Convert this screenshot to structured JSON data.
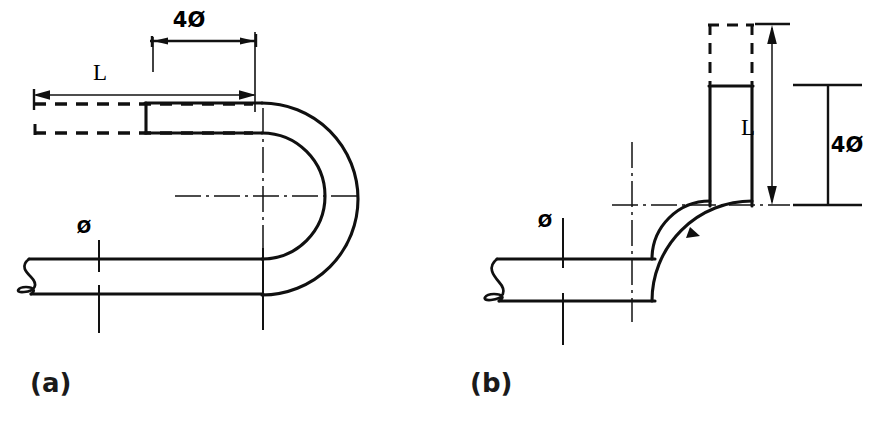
{
  "figure": {
    "background_color": "#ffffff",
    "line_color": "#101010",
    "width": 885,
    "height": 424
  },
  "panel_a": {
    "caption": "(a)",
    "description": "180-degree U-bend tube with straight leg length L and bend dimension 4 diameters",
    "labels": {
      "length": "L",
      "bend_dimension": "4Ø",
      "diameter": "Ø"
    },
    "geometry": {
      "tube_outer_diameter_label": "Ø",
      "bend_span_label": "4Ø",
      "leg_length_label": "L",
      "bend_angle_degrees": 180
    }
  },
  "panel_b": {
    "caption": "(b)",
    "description": "90-degree elbow bend tube with vertical leg length L and bend dimension 4 diameters",
    "labels": {
      "length": "L",
      "bend_dimension": "4Ø",
      "diameter": "Ø"
    },
    "geometry": {
      "tube_outer_diameter_label": "Ø",
      "bend_span_label": "4Ø",
      "leg_length_label": "L",
      "bend_angle_degrees": 90
    }
  }
}
